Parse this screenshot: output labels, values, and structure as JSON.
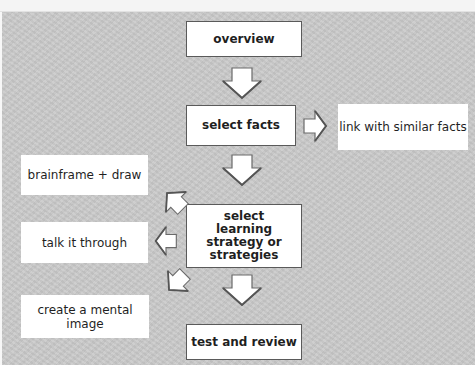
{
  "diagram": {
    "title": "",
    "colors": {
      "panel_background": "#c9c9c9",
      "box_fill": "#ffffff",
      "box_border": "#5a5a5a",
      "text": "#1f1f1f",
      "arrow_fill": "#ffffff",
      "arrow_outline": "#6a6a6a"
    },
    "main_flow": [
      {
        "id": "overview",
        "label": "overview"
      },
      {
        "id": "select_facts",
        "label": "select facts"
      },
      {
        "id": "select_strategy",
        "label": "select learning strategy or strategies"
      },
      {
        "id": "test_review",
        "label": "test and review"
      }
    ],
    "side_nodes": [
      {
        "id": "link_similar",
        "label": "link with similar facts",
        "attached_to": "select_facts"
      },
      {
        "id": "brainframe",
        "label": "brainframe + draw",
        "attached_to": "select_strategy"
      },
      {
        "id": "talk",
        "label": "talk it through",
        "attached_to": "select_strategy"
      },
      {
        "id": "mental_image",
        "label": "create a mental image",
        "attached_to": "select_strategy"
      }
    ],
    "edges": [
      {
        "from": "overview",
        "to": "select_facts",
        "direction": "down"
      },
      {
        "from": "select_facts",
        "to": "link_similar",
        "direction": "right"
      },
      {
        "from": "select_facts",
        "to": "select_strategy",
        "direction": "down"
      },
      {
        "from": "select_strategy",
        "to": "brainframe",
        "direction": "up-left"
      },
      {
        "from": "select_strategy",
        "to": "talk",
        "direction": "left"
      },
      {
        "from": "select_strategy",
        "to": "mental_image",
        "direction": "down-left"
      },
      {
        "from": "select_strategy",
        "to": "test_review",
        "direction": "down"
      }
    ],
    "arrow_icon": "block-arrow-icon"
  }
}
